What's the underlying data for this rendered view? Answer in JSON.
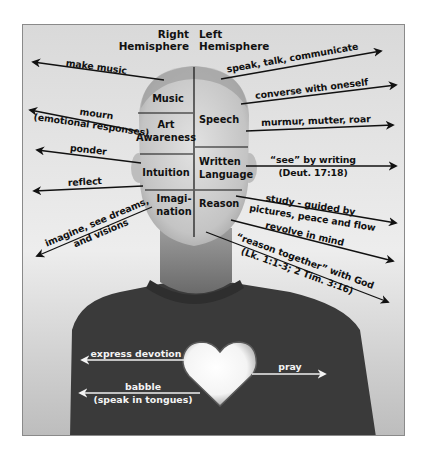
{
  "header": {
    "right_hemisphere": [
      "Right",
      "Hemisphere"
    ],
    "left_hemisphere": [
      "Left",
      "Hemisphere"
    ]
  },
  "regions": {
    "right": [
      {
        "name": "music",
        "lines": [
          "Music"
        ]
      },
      {
        "name": "art-awareness",
        "lines": [
          "Art",
          "Awareness"
        ]
      },
      {
        "name": "intuition",
        "lines": [
          "Intuition"
        ]
      },
      {
        "name": "imagination",
        "lines": [
          "Imagi-",
          "nation"
        ]
      }
    ],
    "left": [
      {
        "name": "speech",
        "lines": [
          "Speech"
        ]
      },
      {
        "name": "written-language",
        "lines": [
          "Written",
          "Language"
        ]
      },
      {
        "name": "reason",
        "lines": [
          "Reason"
        ]
      }
    ]
  },
  "left_arrows": [
    {
      "name": "make-music",
      "lines": [
        "make music"
      ]
    },
    {
      "name": "mourn",
      "lines": [
        "mourn",
        "(emotional responses)"
      ]
    },
    {
      "name": "ponder",
      "lines": [
        "ponder"
      ]
    },
    {
      "name": "reflect",
      "lines": [
        "reflect"
      ]
    },
    {
      "name": "imagine",
      "lines": [
        "imagine, see dreams,",
        "and visions"
      ]
    }
  ],
  "right_arrows": [
    {
      "name": "speak",
      "lines": [
        "speak, talk, communicate"
      ]
    },
    {
      "name": "converse",
      "lines": [
        "converse with oneself"
      ]
    },
    {
      "name": "murmur",
      "lines": [
        "murmur, mutter, roar"
      ]
    },
    {
      "name": "see-by-writing",
      "lines": [
        "“see” by writing",
        "(Deut. 17:18)"
      ]
    },
    {
      "name": "study",
      "lines": [
        "study - guided by",
        "pictures, peace and flow"
      ]
    },
    {
      "name": "revolve",
      "lines": [
        "revolve in mind"
      ]
    },
    {
      "name": "reason-together",
      "lines": [
        "“reason together” with God",
        "(Lk. 1:1-3; 2 Tim. 3:16)"
      ]
    }
  ],
  "heart_arrows": [
    {
      "name": "express-devotion",
      "lines": [
        "express devotion"
      ]
    },
    {
      "name": "babble",
      "lines": [
        "babble",
        "(speak in tongues)"
      ]
    },
    {
      "name": "pray",
      "lines": [
        "pray"
      ]
    }
  ],
  "colors": {
    "background": "#e6e6e6",
    "shirt": "#3a3a3a",
    "skin": "#cfcfcf",
    "ink": "#111111",
    "heart": "#ffffff"
  }
}
